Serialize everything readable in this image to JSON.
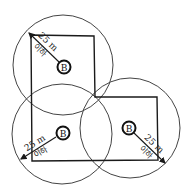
{
  "diagram": {
    "colors": {
      "line": "#1a1a1a",
      "circle": "#444444",
      "background": "#ffffff"
    },
    "building_outline": [
      [
        31,
        35
      ],
      [
        94,
        36
      ],
      [
        95,
        97
      ],
      [
        157,
        97
      ],
      [
        158,
        160
      ],
      [
        32,
        161
      ]
    ],
    "circles": [
      {
        "id": "top",
        "cx": 63,
        "cy": 65,
        "r": 50
      },
      {
        "id": "bottom-left",
        "cx": 62,
        "cy": 134,
        "r": 50
      },
      {
        "id": "right",
        "cx": 130,
        "cy": 128,
        "r": 50
      }
    ],
    "points": [
      {
        "id": "top",
        "label": "B",
        "cx": 64,
        "cy": 67
      },
      {
        "id": "bottom-left",
        "label": "B",
        "cx": 63,
        "cy": 133
      },
      {
        "id": "right",
        "label": "B",
        "cx": 129,
        "cy": 128
      }
    ],
    "radius_labels": [
      {
        "id": "top",
        "distance": "25 m",
        "sub": "이하"
      },
      {
        "id": "bottom-left",
        "distance": "25 m",
        "sub": "이하"
      },
      {
        "id": "right",
        "distance": "25 m",
        "sub": "이하"
      }
    ]
  }
}
